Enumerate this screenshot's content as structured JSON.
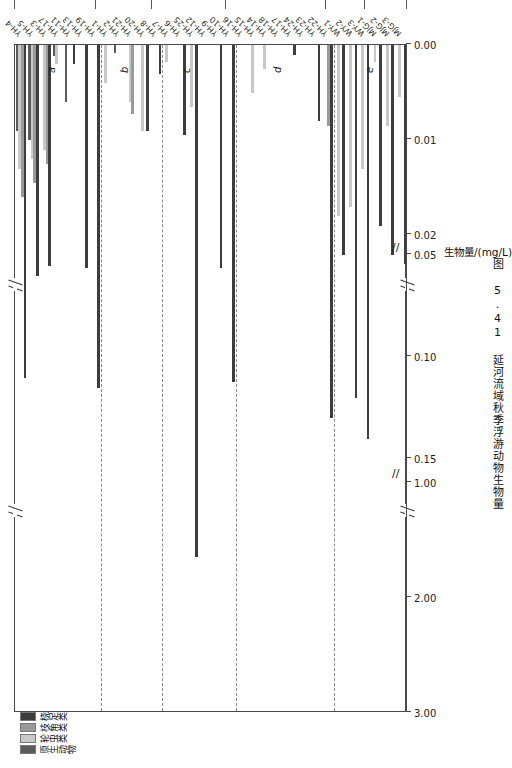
{
  "figure": {
    "caption": "图 5.41  延河流域秋季浮游动物生物量",
    "panel_letters": [
      "a",
      "b",
      "c",
      "d",
      "e"
    ]
  },
  "legend": {
    "title": "",
    "items": [
      {
        "label": "原生动物",
        "color": "#5b5b5b",
        "key": "protozoa"
      },
      {
        "label": "轮虫类",
        "color": "#c8c8c8",
        "key": "rotifer"
      },
      {
        "label": "枝角类",
        "color": "#9a9a9a",
        "key": "cladocera"
      },
      {
        "label": "桡足类",
        "color": "#3d3d3d",
        "key": "copepoda"
      }
    ]
  },
  "value_axis": {
    "title": "生物量/(mg/L)",
    "ticks": [
      "0.00",
      "0.01",
      "0.02",
      "0.05",
      "0.10",
      "0.15",
      "1.00",
      "2.00",
      "3.00"
    ],
    "breaks": [
      2,
      5
    ],
    "break_symbol": "//"
  },
  "region_axis": {
    "labels": [
      "黄土丘陵区",
      "水源地",
      "城市河段",
      "农业川道区",
      "河源保护区",
      "汇入黄河口"
    ]
  },
  "chart_data": {
    "type": "bar",
    "orientation": "horizontal",
    "title": "延河流域秋季浮游动物生物量",
    "xlabel": "生物量/(mg/L)",
    "ylabel": "",
    "grid": false,
    "legend_position": "top-left",
    "xlim": [
      0,
      3.0
    ],
    "axis_breaks": [
      [
        0.02,
        0.05
      ],
      [
        0.15,
        1.0
      ]
    ],
    "categories": [
      "YH-4",
      "YH-5",
      "YH-3",
      "YH-17",
      "YH-11",
      "YH-13",
      "YH-19",
      "YH-1",
      "YH-2",
      "YH-21",
      "YH-20",
      "YH-8",
      "YH-7",
      "YH-6",
      "YH-25",
      "YH-12",
      "YH-9",
      "YH-10",
      "YH-16",
      "YH-15",
      "YH-14",
      "YH-18",
      "YH-17b",
      "YH-24",
      "YH-23",
      "YH-22",
      "WY-1",
      "WY-2",
      "WY-3",
      "MJG-1",
      "MJG-2",
      "MJG-3"
    ],
    "series": [
      {
        "name": "原生动物",
        "color": "#5b5b5b",
        "values": [
          0.009,
          0.01,
          0.0,
          0.0012,
          0.006,
          0.0,
          0.0,
          0.0,
          0.0008,
          0.0,
          0.0,
          0.0,
          0.0,
          0.0,
          0.0,
          0.0,
          0.0,
          0.0,
          0.0,
          0.0,
          0.0,
          0.0,
          0.0,
          0.0,
          0.0,
          0.0,
          0.0,
          0.0,
          0.0,
          0.0,
          0.0,
          0.0
        ]
      },
      {
        "name": "轮虫类",
        "color": "#c8c8c8",
        "values": [
          0.013,
          0.012,
          0.011,
          0.002,
          0.0,
          0.0,
          0.0,
          0.004,
          0.0,
          0.006,
          0.009,
          0.0,
          0.0018,
          0.0,
          0.0065,
          0.0,
          0.0,
          0.0,
          0.0,
          0.005,
          0.0025,
          0.0,
          0.0,
          0.0,
          0.0,
          0.0,
          0.018,
          0.017,
          0.013,
          0.0018,
          0.0085,
          0.0055
        ]
      },
      {
        "name": "枝角类",
        "color": "#9a9a9a",
        "values": [
          0.016,
          0.0145,
          0.0125,
          0.0,
          0.0,
          0.0,
          0.0,
          0.0,
          0.0,
          0.0072,
          0.0,
          0.0,
          0.0,
          0.0,
          0.0,
          0.0,
          0.0,
          0.0,
          0.0,
          0.0,
          0.0,
          0.0,
          0.0,
          0.0,
          0.0,
          0.0085,
          0.0,
          0.0,
          0.0,
          0.0,
          0.0,
          0.0
        ]
      },
      {
        "name": "桡足类",
        "color": "#3d3d3d",
        "values": [
          0.11,
          0.06,
          0.055,
          0.0,
          0.002,
          0.056,
          0.115,
          0.0,
          0.0,
          0.0,
          0.009,
          0.003,
          0.0,
          0.0095,
          1.65,
          0.0,
          0.056,
          0.112,
          0.0,
          0.0,
          0.0,
          0.0,
          0.001,
          0.0,
          0.008,
          0.13,
          0.032,
          0.12,
          0.14,
          0.019,
          0.048,
          0.054
        ]
      }
    ]
  }
}
